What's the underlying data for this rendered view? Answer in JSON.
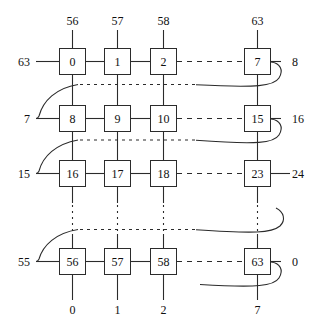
{
  "figure": {
    "type": "torus-mesh-interconnect-diagram",
    "shape": "grid-with-wraparound-links",
    "node_box_count_visible": 16,
    "grid_rows": 8,
    "grid_cols": 8,
    "total_nodes": 64
  },
  "nodes": {
    "rows": [
      {
        "row_index": 0,
        "cells": [
          {
            "label": "0",
            "col": 0
          },
          {
            "label": "1",
            "col": 1
          },
          {
            "label": "2",
            "col": 2
          },
          {
            "label": "7",
            "col": 7
          }
        ]
      },
      {
        "row_index": 1,
        "cells": [
          {
            "label": "8",
            "col": 0
          },
          {
            "label": "9",
            "col": 1
          },
          {
            "label": "10",
            "col": 2
          },
          {
            "label": "15",
            "col": 7
          }
        ]
      },
      {
        "row_index": 2,
        "cells": [
          {
            "label": "16",
            "col": 0
          },
          {
            "label": "17",
            "col": 1
          },
          {
            "label": "18",
            "col": 2
          },
          {
            "label": "23",
            "col": 7
          }
        ]
      },
      {
        "row_index": 7,
        "cells": [
          {
            "label": "56",
            "col": 0
          },
          {
            "label": "57",
            "col": 1
          },
          {
            "label": "58",
            "col": 2
          },
          {
            "label": "63",
            "col": 7
          }
        ]
      }
    ]
  },
  "labels": {
    "top": [
      "56",
      "57",
      "58",
      "63"
    ],
    "bottom": [
      "0",
      "1",
      "2",
      "7"
    ],
    "left": [
      "63",
      "7",
      "15",
      "55"
    ],
    "right": [
      "8",
      "16",
      "24",
      "0"
    ]
  },
  "colors": {
    "stroke": "#2b2b2b",
    "text": "#101010",
    "background": "#ffffff"
  }
}
